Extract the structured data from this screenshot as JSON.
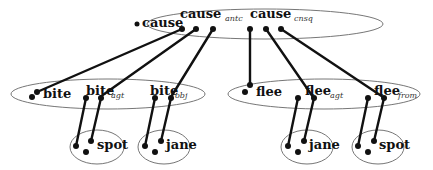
{
  "diagram": {
    "type": "semantic-network",
    "colors": {
      "line": "#111111",
      "ellipse": "#666666",
      "background": "#ffffff"
    },
    "groups": {
      "cause": {
        "labels": {
          "main": "cause",
          "antc": "cause",
          "antc_sub": "antc",
          "cnsq": "cause",
          "cnsq_sub": "cnsq"
        }
      },
      "bite": {
        "labels": {
          "main": "bite",
          "agt": "bite",
          "agt_sub": "agt",
          "obj": "bite",
          "obj_sub": "obj"
        }
      },
      "flee": {
        "labels": {
          "main": "flee",
          "agt": "flee",
          "agt_sub": "agt",
          "from": "flee",
          "from_sub": "from"
        }
      },
      "spot1": {
        "label": "spot"
      },
      "jane1": {
        "label": "jane"
      },
      "jane2": {
        "label": "jane"
      },
      "spot2": {
        "label": "spot"
      }
    },
    "edges": [
      {
        "from": "cause",
        "to": "bite"
      },
      {
        "from": "cause_antc",
        "to": "bite_agt"
      },
      {
        "from": "cause_antc",
        "to": "bite_obj"
      },
      {
        "from": "cause_cnsq",
        "to": "flee"
      },
      {
        "from": "cause_cnsq",
        "to": "flee_agt"
      },
      {
        "from": "cause_cnsq",
        "to": "flee_from"
      },
      {
        "from": "bite",
        "to": "spot"
      },
      {
        "from": "bite_agt",
        "to": "spot"
      },
      {
        "from": "bite_obj",
        "to": "jane"
      },
      {
        "from": "flee_agt",
        "to": "jane"
      },
      {
        "from": "flee_from",
        "to": "spot"
      }
    ]
  }
}
